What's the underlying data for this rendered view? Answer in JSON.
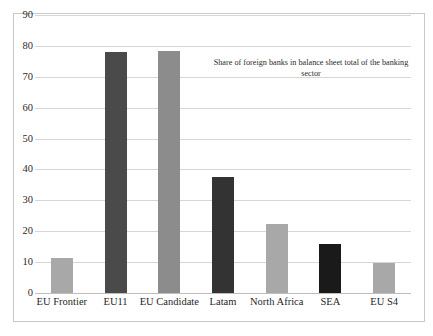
{
  "chart_data": {
    "type": "bar",
    "title": "",
    "annotation": "Share  of foreign banks in balance sheet total of the banking sector",
    "categories": [
      "EU Frontier",
      "EU11",
      "EU Candidate",
      "Latam",
      "North Africa",
      "SEA",
      "EU S4"
    ],
    "values": [
      11.3,
      78.0,
      78.3,
      37.5,
      22.2,
      16.0,
      9.7
    ],
    "bar_colors": [
      "#a8a8a8",
      "#4a4a4a",
      "#8c8c8c",
      "#333333",
      "#a8a8a8",
      "#1a1a1a",
      "#a8a8a8"
    ],
    "xlabel": "",
    "ylabel": "",
    "ylim": [
      0,
      90
    ],
    "yticks": [
      0,
      10,
      20,
      30,
      40,
      50,
      60,
      70,
      80,
      90
    ],
    "ytick_labels": [
      "0",
      "10",
      "20",
      "30",
      "40",
      "50",
      "60",
      "70",
      "80",
      "90"
    ],
    "grid": true,
    "legend": "none",
    "gridline_color": "#d6d6d6",
    "frame_color": "#c9c9c9"
  }
}
